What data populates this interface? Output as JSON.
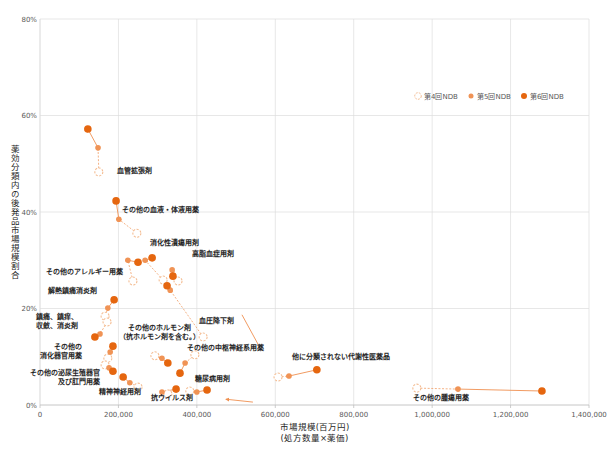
{
  "chart_data": {
    "type": "scatter",
    "title": "",
    "grid": true,
    "legend_position": "top-right-inside",
    "x_axis": {
      "title_lines": [
        "市場規模(百万円)",
        "(処方数量×薬価)"
      ],
      "min": 0,
      "max": 1400000,
      "tick_step": 200000,
      "ticks": [
        0,
        200000,
        400000,
        600000,
        800000,
        1000000,
        1200000,
        1400000
      ],
      "tick_labels": [
        "0",
        "200,000",
        "400,000",
        "600,000",
        "800,000",
        "1,000,000",
        "1,200,000",
        "1,400,000"
      ]
    },
    "y_axis": {
      "title": "薬効分類内の後発品市場規模割合",
      "min": 0,
      "max": 80,
      "tick_step": 20,
      "ticks": [
        0,
        20,
        40,
        60,
        80
      ],
      "tick_labels": [
        "0%",
        "20%",
        "40%",
        "60%",
        "80%"
      ]
    },
    "legend": [
      {
        "name": "第4回NDB",
        "marker": "open"
      },
      {
        "name": "第5回NDB",
        "marker": "light"
      },
      {
        "name": "第6回NDB",
        "marker": "dark"
      }
    ],
    "colors": {
      "ndb4_stroke": "#f4bd93",
      "ndb4_fill": "#ffffff",
      "ndb5": "#f09355",
      "ndb6": "#e5660f",
      "connector": "#ef9050",
      "grid": "#dcdcdc",
      "axis": "#bfbfbf",
      "tick_text": "#595959",
      "label_text": "#262626"
    },
    "series_order": [
      "ndb4",
      "ndb5",
      "ndb6"
    ],
    "categories": [
      {
        "label_lines": [
          "血管拡張剤"
        ],
        "anchor": "start",
        "label_pos": [
          196000,
          48.0
        ],
        "points": {
          "ndb4": [
            150000,
            48.3
          ],
          "ndb5": [
            148000,
            53.3
          ],
          "ndb6": [
            122000,
            57.2
          ]
        }
      },
      {
        "label_lines": [
          "その他の血液・体液用薬"
        ],
        "anchor": "start",
        "label_pos": [
          209000,
          40.0
        ],
        "points": {
          "ndb4": [
            247000,
            35.6
          ],
          "ndb5": [
            201000,
            38.5
          ],
          "ndb6": [
            194000,
            42.3
          ]
        }
      },
      {
        "label_lines": [
          "消化性潰瘍用剤"
        ],
        "anchor": "middle",
        "label_pos": [
          344000,
          33.2
        ],
        "points": {
          "ndb4": [
            314000,
            25.9
          ],
          "ndb5": [
            268000,
            30.0
          ],
          "ndb6": [
            286000,
            30.5
          ]
        }
      },
      {
        "label_lines": [
          "高脂血症用剤"
        ],
        "anchor": "middle",
        "label_pos": [
          441000,
          30.9
        ],
        "points": {
          "ndb4": [
            352000,
            25.7
          ],
          "ndb5": [
            337000,
            28.0
          ],
          "ndb6": [
            339000,
            26.7
          ]
        }
      },
      {
        "label_lines": [
          "その他のアレルギー用薬"
        ],
        "anchor": "end",
        "label_pos": [
          212000,
          27.2
        ],
        "points": {
          "ndb4": [
            237000,
            25.7
          ],
          "ndb5": [
            224000,
            30.0
          ],
          "ndb6": [
            250000,
            29.6
          ]
        }
      },
      {
        "label_lines": [
          "解熱鎮痛消炎剤"
        ],
        "anchor": "end",
        "label_pos": [
          145000,
          23.2
        ],
        "points": {
          "ndb4": [
            166000,
            18.4
          ],
          "ndb5": [
            173000,
            20.1
          ],
          "ndb6": [
            189000,
            21.8
          ]
        }
      },
      {
        "label_lines": [
          "鎮痛、鎮痒、",
          "収斂、消炎剤"
        ],
        "anchor": "end",
        "label_pos": [
          97000,
          17.8
        ],
        "points": {
          "ndb4": [
            171000,
            17.2
          ],
          "ndb5": [
            153000,
            14.7
          ],
          "ndb6": [
            140000,
            14.1
          ]
        }
      },
      {
        "label_lines": [
          "その他の",
          "消化器官用薬"
        ],
        "anchor": "end",
        "label_pos": [
          107000,
          11.6
        ],
        "points": {
          "ndb4": [
            173000,
            9.7
          ],
          "ndb5": [
            179000,
            11.0
          ],
          "ndb6": [
            186000,
            12.2
          ]
        }
      },
      {
        "label_lines": [
          "その他の泌尿生殖器官",
          "及び肛門用薬"
        ],
        "anchor": "end",
        "label_pos": [
          153000,
          6.2
        ],
        "points": {
          "ndb4": [
            166000,
            8.3
          ],
          "ndb5": [
            176000,
            7.7
          ],
          "ndb6": [
            186000,
            7.0
          ]
        }
      },
      {
        "label_lines": [
          "精神神経用剤"
        ],
        "anchor": "middle",
        "label_pos": [
          204000,
          2.3
        ],
        "points": {
          "ndb4": [
            250000,
            3.7
          ],
          "ndb5": [
            229000,
            4.6
          ],
          "ndb6": [
            212000,
            5.8
          ]
        }
      },
      {
        "label_lines": [
          "その他のホルモン剤",
          "（抗ホルモン剤を含む。）"
        ],
        "anchor": "middle",
        "label_pos": [
          306000,
          15.5
        ],
        "points": {
          "ndb4": [
            293000,
            10.2
          ],
          "ndb5": [
            311000,
            9.7
          ],
          "ndb6": [
            326000,
            8.7
          ]
        }
      },
      {
        "label_lines": [
          "血圧降下剤"
        ],
        "anchor": "middle",
        "label_pos": [
          451000,
          17.0
        ],
        "points": {
          "ndb4": [
            416000,
            14.1
          ],
          "ndb5": [
            332000,
            23.8
          ],
          "ndb6": [
            324000,
            24.7
          ]
        }
      },
      {
        "label_lines": [
          "その他の中枢神経系用薬"
        ],
        "anchor": "middle",
        "label_pos": [
          474000,
          11.4
        ],
        "points": {
          "ndb4": [
            395000,
            10.4
          ],
          "ndb5": [
            370000,
            8.7
          ],
          "ndb6": [
            357000,
            6.6
          ]
        }
      },
      {
        "label_lines": [
          "糖尿病用剤"
        ],
        "anchor": "middle",
        "label_pos": [
          441000,
          5.0
        ],
        "points": {
          "ndb4": [
            382000,
            2.9
          ],
          "ndb5": [
            400000,
            2.7
          ],
          "ndb6": [
            426000,
            3.1
          ]
        }
      },
      {
        "label_lines": [
          "抗ウイルス剤"
        ],
        "anchor": "middle",
        "label_pos": [
          337000,
          1.0
        ],
        "points": {
          "ndb4": [
            326000,
            2.3
          ],
          "ndb5": [
            311000,
            2.7
          ],
          "ndb6": [
            347000,
            3.3
          ]
        }
      },
      {
        "label_lines": [
          "他に分類されない代謝性医薬品"
        ],
        "anchor": "start",
        "label_pos": [
          643000,
          9.5
        ],
        "points": {
          "ndb4": [
            607000,
            5.8
          ],
          "ndb5": [
            635000,
            6.0
          ],
          "ndb6": [
            706000,
            7.3
          ]
        }
      },
      {
        "label_lines": [
          "その他の腫瘍用薬"
        ],
        "anchor": "start",
        "label_pos": [
          951000,
          1.0
        ],
        "points": {
          "ndb4": [
            961000,
            3.5
          ],
          "ndb5": [
            1066000,
            3.3
          ],
          "ndb6": [
            1280000,
            2.9
          ]
        }
      }
    ],
    "extra_arrows": [
      {
        "from": [
          543000,
          0.6
        ],
        "to": [
          474000,
          1.2
        ],
        "style": "solid",
        "arrow": true
      },
      {
        "from": [
          515000,
          18.7
        ],
        "to": [
          556000,
          12.6
        ],
        "style": "solid",
        "arrow": false
      }
    ]
  }
}
